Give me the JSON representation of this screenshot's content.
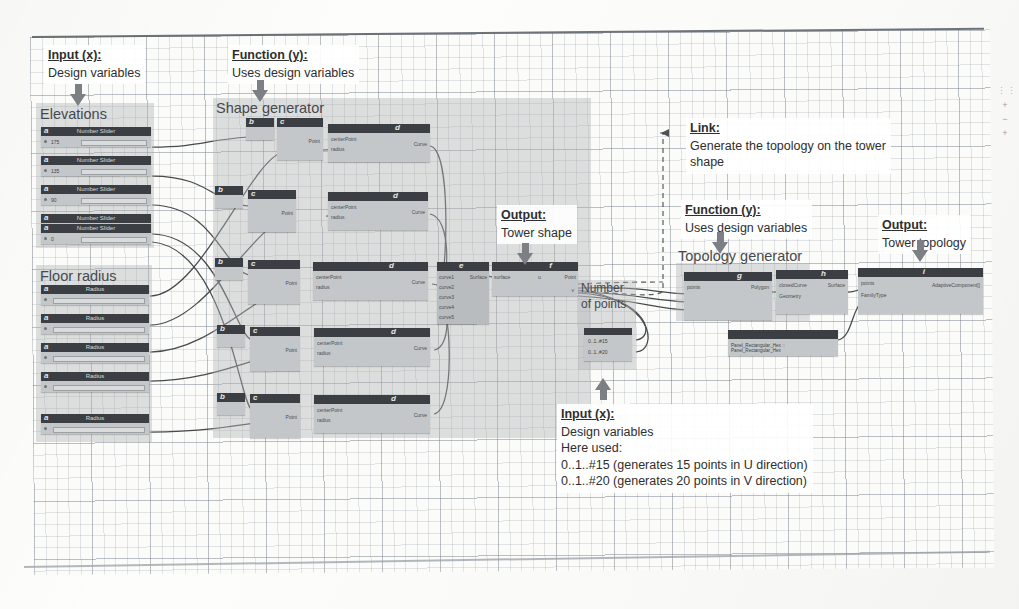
{
  "figure": {
    "canvas_background": "#fbfbfa",
    "node_header_color": "#3b3f44",
    "node_body_color": "#c4c7c9",
    "group_color": "#b0b3b6"
  },
  "callouts": [
    {
      "id": "input-left",
      "head": "Input (x):",
      "lines": [
        "Design variables"
      ]
    },
    {
      "id": "function-left",
      "head": "Function (y):",
      "lines": [
        "Uses design variables"
      ]
    },
    {
      "id": "output-middle",
      "head": "Output:",
      "lines": [
        "Tower shape"
      ]
    },
    {
      "id": "link-right",
      "head": "Link:",
      "lines": [
        "Generate the topology on the tower",
        "shape"
      ]
    },
    {
      "id": "function-right",
      "head": "Function (y):",
      "lines": [
        "Uses design variables"
      ]
    },
    {
      "id": "output-right",
      "head": "Output:",
      "lines": [
        "Tower topology"
      ]
    },
    {
      "id": "input-bottom",
      "head": "Input (x):",
      "lines": [
        "Design variables",
        "Here used:",
        "0..1..#15 (generates 15 points in U direction)",
        "0..1..#20 (generates 20 points in V direction)"
      ]
    }
  ],
  "groups": [
    {
      "id": "elevations",
      "title": "Elevations"
    },
    {
      "id": "floor-radius",
      "title": "Floor radius"
    },
    {
      "id": "shape-generator",
      "title": "Shape generator"
    },
    {
      "id": "number-of-points",
      "title": "Number of points",
      "title_line2": "of points",
      "title_line1": "Number"
    },
    {
      "id": "topology-generator",
      "title": "Topology generator"
    }
  ],
  "elevations": {
    "group_title": "Elevations",
    "nodes": [
      {
        "tag": "a",
        "name": "Number Slider",
        "value": "175"
      },
      {
        "tag": "a",
        "name": "Number Slider",
        "value": "135"
      },
      {
        "tag": "a",
        "name": "Number Slider",
        "value": "90"
      },
      {
        "tag": "a",
        "name": "Number Slider",
        "value": "45"
      },
      {
        "tag": "a",
        "name": "Number Slider",
        "value": "0"
      }
    ]
  },
  "floor_radius": {
    "group_title": "Floor radius",
    "nodes": [
      {
        "tag": "a",
        "name": "Radius",
        "value": "8"
      },
      {
        "tag": "a",
        "name": "Radius",
        "value": "7"
      },
      {
        "tag": "a",
        "name": "Radius",
        "value": "10.5"
      },
      {
        "tag": "a",
        "name": "Radius",
        "value": "16"
      },
      {
        "tag": "a",
        "name": "Radius",
        "value": "21"
      }
    ]
  },
  "shape_generator": {
    "group_title": "Shape generator",
    "rows": [
      {
        "tags": [
          "b",
          "c",
          "d"
        ],
        "names": [
          "Point.ByCoordinates",
          "Circle.ByCenterPointRadius",
          "Curve"
        ]
      },
      {
        "tags": [
          "b",
          "c",
          "d"
        ],
        "names": [
          "Point.ByCoordinates",
          "Circle.ByCenterPointRadius",
          "Curve"
        ]
      },
      {
        "tags": [
          "b",
          "c",
          "d"
        ],
        "names": [
          "Point.ByCoordinates",
          "Circle.ByCenterPointRadius",
          "Curve"
        ]
      },
      {
        "tags": [
          "b",
          "c",
          "d"
        ],
        "names": [
          "Point.ByCoordinates",
          "Circle.ByCenterPointRadius",
          "Curve"
        ]
      },
      {
        "tags": [
          "b",
          "c",
          "d"
        ],
        "names": [
          "Point.ByCoordinates",
          "Circle.ByCenterPointRadius",
          "Curve"
        ]
      }
    ],
    "port_labels": [
      "Point",
      "Radius",
      "Curve",
      "centerPoint",
      "radius"
    ]
  },
  "surface_chain": {
    "nodes": [
      {
        "tag": "e",
        "name": "Surface.ByLoft",
        "inputs": [
          "curve1",
          "curve2",
          "curve3",
          "curve4",
          "curve5"
        ],
        "output": "Surface"
      },
      {
        "tag": "f",
        "name": "Surface.PointAtParameter",
        "inputs": [
          "surface",
          "u",
          "v"
        ],
        "output": "Point"
      }
    ]
  },
  "number_of_points": {
    "group_title_line1": "Number",
    "group_title_line2": "of points",
    "nodes": [
      {
        "name": "Code Block",
        "value": "0..1..#15"
      },
      {
        "name": "Code Block",
        "value": "0..1..#20"
      }
    ]
  },
  "topology_generator": {
    "group_title": "Topology generator",
    "nodes": [
      {
        "tag": "g",
        "name": "Polygon.ByPoints",
        "inputs": [
          "points"
        ],
        "output": "Polygon"
      },
      {
        "tag": "h",
        "name": "Surface.ByPatch",
        "inputs": [
          "closedCurve",
          "Geometry"
        ],
        "output": "Surface"
      },
      {
        "tag": "i",
        "name": "AdaptiveComponent.ByPoints",
        "inputs": [
          "points",
          "FamilyType"
        ],
        "output": "AdaptiveComponent[]"
      },
      {
        "name": "Family Types",
        "value": "Panel_Rectangular_Hex :: Panel_Rectangular_Hex"
      }
    ]
  },
  "zoom_controls": {
    "grip": "⋮⋮",
    "zoom_in": "+",
    "zoom_out": "−",
    "fit": "+"
  }
}
